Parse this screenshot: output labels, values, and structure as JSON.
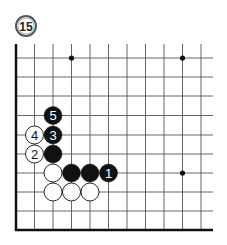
{
  "diagram": {
    "label": "15",
    "board": {
      "x_lines": [
        16,
        34.5,
        53,
        71.5,
        90,
        108.5,
        127,
        145.5,
        164,
        182.5,
        201
      ],
      "y_lines": [
        58,
        77,
        96,
        115.5,
        135,
        154,
        173,
        192,
        211,
        230
      ],
      "right_edge": 213,
      "top_edge": 44,
      "line_color": "#555555",
      "edge_color": "#111111"
    },
    "star_points": [
      {
        "col": 3,
        "row": 0
      },
      {
        "col": 9,
        "row": 0
      },
      {
        "col": 9,
        "row": 6
      }
    ],
    "stones": [
      {
        "color": "black",
        "col": 2,
        "row": 3,
        "label": "5"
      },
      {
        "color": "black",
        "col": 2,
        "row": 4,
        "label": "3"
      },
      {
        "color": "white",
        "col": 1,
        "row": 4,
        "label": "4"
      },
      {
        "color": "white",
        "col": 1,
        "row": 5,
        "label": "2"
      },
      {
        "color": "black",
        "col": 2,
        "row": 5,
        "label": ""
      },
      {
        "color": "white",
        "col": 2,
        "row": 6,
        "label": ""
      },
      {
        "color": "black",
        "col": 3,
        "row": 6,
        "label": ""
      },
      {
        "color": "black",
        "col": 4,
        "row": 6,
        "label": ""
      },
      {
        "color": "black",
        "col": 5,
        "row": 6,
        "label": "1"
      },
      {
        "color": "white",
        "col": 2,
        "row": 7,
        "label": ""
      },
      {
        "color": "white",
        "col": 3,
        "row": 7,
        "label": ""
      },
      {
        "color": "white",
        "col": 4,
        "row": 7,
        "label": ""
      }
    ]
  }
}
